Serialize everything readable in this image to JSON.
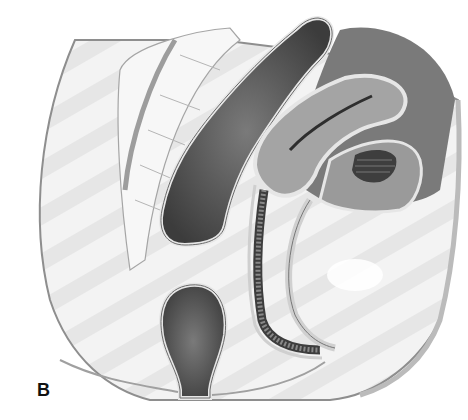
{
  "figure": {
    "panel_label": "B",
    "colors": {
      "background": "#ffffff",
      "body_fill": "#f1f1f1",
      "outline": "#9a9a9a",
      "organ_dark": "#4a4a4a",
      "organ_mid": "#8c8c8c",
      "organ_light": "#b8b8b8",
      "bone": "#f6f6f6"
    }
  }
}
